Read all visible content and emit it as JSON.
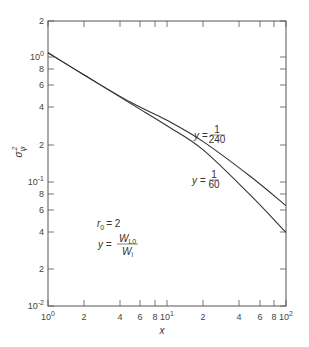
{
  "chart_data": {
    "type": "line",
    "title": "",
    "xlabel": "x",
    "ylabel": "σ_ψ^2",
    "xscale": "log",
    "yscale": "log",
    "xlim": [
      1,
      100
    ],
    "ylim": [
      0.01,
      2
    ],
    "grid": false,
    "x_tick_labels": [
      "10^0",
      "2",
      "4",
      "6",
      "8",
      "10^1",
      "2",
      "4",
      "6",
      "8",
      "10^2"
    ],
    "y_tick_labels": [
      "2",
      "10^0",
      "8",
      "6",
      "4",
      "2",
      "10^-1",
      "8",
      "6",
      "4",
      "2",
      "10^-2"
    ],
    "x": [
      1,
      2,
      5,
      10,
      20,
      50,
      100
    ],
    "series": [
      {
        "name": "y = 1/240",
        "values": [
          1.08,
          0.72,
          0.43,
          0.31,
          0.21,
          0.11,
          0.064
        ]
      },
      {
        "name": "y = 1/60",
        "values": [
          1.08,
          0.72,
          0.42,
          0.28,
          0.18,
          0.078,
          0.039
        ]
      }
    ],
    "annotations": [
      {
        "text": "y = 1/240",
        "near": "upper curve, x≈30"
      },
      {
        "text": "y = 1/60",
        "near": "lower curve, x≈30"
      },
      {
        "text": "r_0 = 2"
      },
      {
        "text": "y = W_L0 / W_i"
      }
    ]
  },
  "labels": {
    "xlabel": "x",
    "ylabel_main": "σ",
    "ylabel_sub": "ψ",
    "ylabel_sup": "2",
    "curve_upper_lhs": "y =",
    "curve_upper_num": "1",
    "curve_upper_den": "240",
    "curve_lower_lhs": "y =",
    "curve_lower_num": "1",
    "curve_lower_den": "60",
    "r0_text": "r",
    "r0_sub": "0",
    "r0_value": "= 2",
    "ratio_lhs": "y =",
    "ratio_num": "W",
    "ratio_num_sub": "L0",
    "ratio_den": "W",
    "ratio_den_sub": "i"
  },
  "ticks": {
    "x": [
      {
        "label": "10",
        "sup": "0",
        "px": 48
      },
      {
        "label": "2",
        "sup": "",
        "px": 84
      },
      {
        "label": "4",
        "sup": "",
        "px": 120
      },
      {
        "label": "6",
        "sup": "",
        "px": 140
      },
      {
        "label": "8",
        "sup": "",
        "px": 155
      },
      {
        "label": "10",
        "sup": "1",
        "px": 167
      },
      {
        "label": "2",
        "sup": "",
        "px": 203
      },
      {
        "label": "4",
        "sup": "",
        "px": 239
      },
      {
        "label": "6",
        "sup": "",
        "px": 260
      },
      {
        "label": "8",
        "sup": "",
        "px": 274
      },
      {
        "label": "10",
        "sup": "2",
        "px": 286
      }
    ],
    "y": [
      {
        "label": "2",
        "sup": "",
        "px": 21
      },
      {
        "label": "10",
        "sup": "0",
        "px": 57
      },
      {
        "label": "8",
        "sup": "",
        "px": 69
      },
      {
        "label": "6",
        "sup": "",
        "px": 85
      },
      {
        "label": "4",
        "sup": "",
        "px": 107
      },
      {
        "label": "2",
        "sup": "",
        "px": 145
      },
      {
        "label": "10",
        "sup": "-1",
        "px": 182
      },
      {
        "label": "8",
        "sup": "",
        "px": 194
      },
      {
        "label": "6",
        "sup": "",
        "px": 210
      },
      {
        "label": "4",
        "sup": "",
        "px": 232
      },
      {
        "label": "2",
        "sup": "",
        "px": 269
      },
      {
        "label": "10",
        "sup": "-2",
        "px": 306
      }
    ]
  }
}
